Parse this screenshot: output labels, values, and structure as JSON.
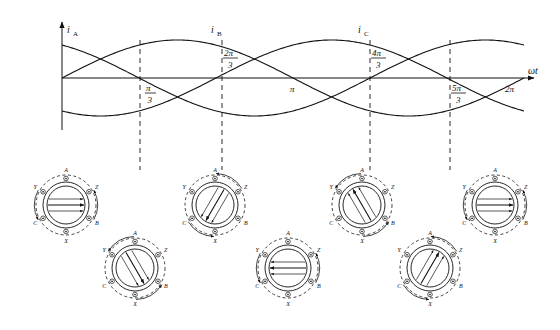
{
  "figure": {
    "axes": {
      "x_axis_label": "ωt",
      "curve_labels": [
        {
          "id": "iA",
          "text": "i",
          "sub": "A"
        },
        {
          "id": "iB",
          "text": "i",
          "sub": "B"
        },
        {
          "id": "iC",
          "text": "i",
          "sub": "C"
        }
      ],
      "x_ticks": [
        {
          "label": "π/3",
          "num": "π",
          "den": "3",
          "x": 140
        },
        {
          "label": "2π/3",
          "num": "2π",
          "den": "3",
          "x": 222
        },
        {
          "label": "π",
          "num": "π",
          "den": "",
          "x": 292
        },
        {
          "label": "4π/3",
          "num": "4π",
          "den": "3",
          "x": 370
        },
        {
          "label": "5π/3",
          "num": "5π",
          "den": "3",
          "x": 450
        },
        {
          "label": "2π",
          "num": "2π",
          "den": "",
          "x": 512
        }
      ]
    },
    "waveform": {
      "type": "sine",
      "phases_deg": [
        0,
        -120,
        120
      ],
      "amplitude_px": 38,
      "baseline_y": 78,
      "x_start": 62,
      "x_end": 524,
      "cycles": 1
    },
    "coil_terminals": [
      "A",
      "Z",
      "B",
      "X",
      "C",
      "Y"
    ],
    "coil_groups": [
      {
        "name": "coil-diagram-1",
        "cx": 66,
        "cy": 205,
        "r": 30,
        "field_angle_deg": 0,
        "labels": [
          "A",
          "Z",
          "B",
          "X",
          "C",
          "Y"
        ]
      },
      {
        "name": "coil-diagram-2",
        "cx": 135,
        "cy": 268,
        "r": 30,
        "field_angle_deg": -60,
        "labels": [
          "A",
          "Z",
          "B",
          "X",
          "C",
          "Y"
        ]
      },
      {
        "name": "coil-diagram-3",
        "cx": 215,
        "cy": 205,
        "r": 30,
        "field_angle_deg": -120,
        "labels": [
          "A",
          "Z",
          "B",
          "X",
          "C",
          "Y"
        ]
      },
      {
        "name": "coil-diagram-4",
        "cx": 288,
        "cy": 268,
        "r": 30,
        "field_angle_deg": 180,
        "labels": [
          "A",
          "Z",
          "B",
          "X",
          "C",
          "Y"
        ]
      },
      {
        "name": "coil-diagram-5",
        "cx": 362,
        "cy": 205,
        "r": 30,
        "field_angle_deg": 120,
        "labels": [
          "A",
          "Z",
          "B",
          "X",
          "C",
          "Y"
        ]
      },
      {
        "name": "coil-diagram-6",
        "cx": 430,
        "cy": 268,
        "r": 30,
        "field_angle_deg": 60,
        "labels": [
          "A",
          "Z",
          "B",
          "X",
          "C",
          "Y"
        ]
      },
      {
        "name": "coil-diagram-7",
        "cx": 495,
        "cy": 205,
        "r": 30,
        "field_angle_deg": 0,
        "labels": [
          "A",
          "Z",
          "B",
          "X",
          "C",
          "Y"
        ]
      }
    ],
    "dashed_droplines": [
      140,
      222,
      370,
      450
    ],
    "colors": {
      "stroke": "#111111",
      "background": "#ffffff"
    }
  }
}
